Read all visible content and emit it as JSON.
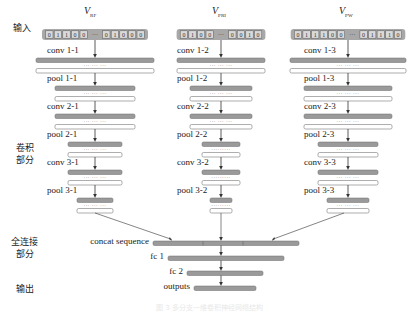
{
  "side_labels": {
    "input": "输入",
    "conv_part": [
      "卷积",
      "部分"
    ],
    "fc_part": [
      "全连接",
      "部分"
    ],
    "output": "输出"
  },
  "columns": [
    {
      "title_main": "V",
      "title_sub": "RF",
      "input_bits_left": [
        "0",
        "1",
        "1",
        "0",
        "0"
      ],
      "input_bits_right": [
        "0",
        "1",
        "0",
        "0",
        "0"
      ],
      "ellipsis": "···",
      "layers": [
        {
          "label": "conv 1-1",
          "width": 118
        },
        {
          "label": "pool 1-1",
          "width": 80
        },
        {
          "label": "conv 2-1",
          "width": 80
        },
        {
          "label": "pool 2-1",
          "width": 54
        },
        {
          "label": "conv 3-1",
          "width": 54
        },
        {
          "label": "pool 3-1",
          "width": 36
        }
      ]
    },
    {
      "title_main": "V",
      "title_sub": "PRI",
      "input_bits_left": [
        "0",
        "1",
        "0",
        "0"
      ],
      "input_bits_right": [
        "0",
        "0",
        "1",
        "0"
      ],
      "ellipsis": "···",
      "layers": [
        {
          "label": "conv 1-2",
          "width": 88
        },
        {
          "label": "pool 1-2",
          "width": 62
        },
        {
          "label": "conv 2-2",
          "width": 62
        },
        {
          "label": "pool 2-2",
          "width": 38
        },
        {
          "label": "conv 3-2",
          "width": 38
        },
        {
          "label": "pool 3-2",
          "width": 22
        }
      ]
    },
    {
      "title_main": "V",
      "title_sub": "PW",
      "input_bits_left": [
        "0",
        "1",
        "1",
        "1",
        "0",
        "0"
      ],
      "input_bits_right": [
        "0",
        "1",
        "1",
        "1",
        "0"
      ],
      "ellipsis": "···",
      "layers": [
        {
          "label": "conv 1-3",
          "width": 116
        },
        {
          "label": "pool 1-3",
          "width": 88
        },
        {
          "label": "conv 2-3",
          "width": 88
        },
        {
          "label": "pool 2-3",
          "width": 60
        },
        {
          "label": "conv 3-3",
          "width": 60
        },
        {
          "label": "pool 3-3",
          "width": 42
        }
      ]
    }
  ],
  "dense": [
    {
      "label": "concat sequence",
      "x": 153,
      "width": 146,
      "segments": [
        203,
        243
      ]
    },
    {
      "label": "fc 1",
      "x": 168,
      "width": 116
    },
    {
      "label": "fc 2",
      "x": 187,
      "width": 76
    },
    {
      "label": "outputs",
      "x": 194,
      "width": 62
    }
  ],
  "caption": "图 3  多分支一维卷积神经网络结构",
  "colors": {
    "bar_fill": "#9a9a9a",
    "bar_stroke": "#6a6a6a",
    "input_bg": "#a8a8a8",
    "cell_bg": "#d9d9d9",
    "line": "#333333"
  }
}
